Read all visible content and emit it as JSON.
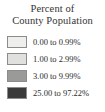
{
  "legend": {
    "title": {
      "line1": "Percent of",
      "line2": "County Population"
    },
    "background_color": "#ffffff",
    "text_color": "#2b2b2b",
    "swatch_border_color": "#8c8c8c",
    "classes": [
      {
        "label": "0.00 to 0.99%",
        "color": "#eeeeec",
        "range_min": 0.0,
        "range_max": 0.99
      },
      {
        "label": "1.00 to 2.99%",
        "color": "#e0e0de",
        "range_min": 1.0,
        "range_max": 2.99
      },
      {
        "label": "3.00 to 9.99%",
        "color": "#9a9a98",
        "range_min": 3.0,
        "range_max": 9.99
      },
      {
        "label": "25.00 to 97.22%",
        "color": "#3a3a3a",
        "range_min": 25.0,
        "range_max": 97.22
      }
    ]
  }
}
